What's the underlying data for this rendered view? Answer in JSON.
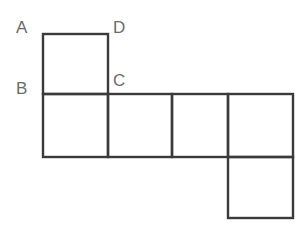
{
  "figure": {
    "background_color": "#ffffff",
    "stroke_color": "#3a3a3a",
    "stroke_width": 2.4,
    "label_color": "#6b6b6b"
  },
  "labels": {
    "a": "A",
    "b": "B",
    "c": "C",
    "d": "D"
  },
  "geometry": {
    "cell_size": 64,
    "columns_x": [
      43,
      108,
      172,
      228,
      293
    ],
    "rows_y": [
      34,
      94,
      157,
      218
    ],
    "squares": [
      {
        "name": "top-square",
        "x": 43,
        "y": 34,
        "w": 65,
        "h": 60
      },
      {
        "name": "middle-square-1",
        "x": 43,
        "y": 94,
        "w": 65,
        "h": 63
      },
      {
        "name": "middle-square-2",
        "x": 108,
        "y": 94,
        "w": 64,
        "h": 63
      },
      {
        "name": "middle-square-3",
        "x": 172,
        "y": 94,
        "w": 56,
        "h": 63
      },
      {
        "name": "middle-square-4",
        "x": 228,
        "y": 94,
        "w": 65,
        "h": 63
      },
      {
        "name": "bottom-square",
        "x": 228,
        "y": 157,
        "w": 65,
        "h": 61
      }
    ]
  }
}
